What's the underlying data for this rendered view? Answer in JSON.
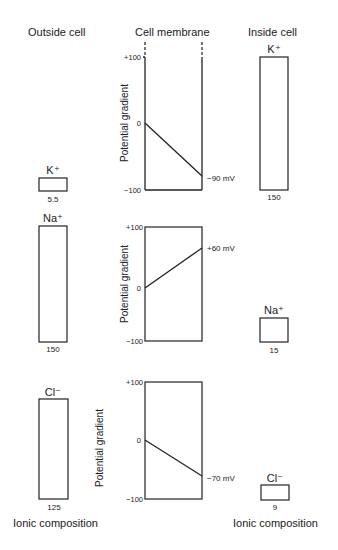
{
  "headers": {
    "outside": "Outside cell",
    "membrane": "Cell membrane",
    "inside": "Inside cell"
  },
  "footer": {
    "left": "Ionic composition",
    "right": "Ionic composition"
  },
  "axis_label": "Potential gradient",
  "ticks": {
    "top": "+100",
    "zero": "0",
    "bottom": "−100"
  },
  "panels": [
    {
      "ion": "K+",
      "ion_label": "K⁺",
      "outside_conc": "5.5",
      "inside_conc": "150",
      "potential_label": "−90 mV",
      "potential": -90
    },
    {
      "ion": "Na+",
      "ion_label": "Na⁺",
      "outside_conc": "150",
      "inside_conc": "15",
      "potential_label": "+60 mV",
      "potential": 60
    },
    {
      "ion": "Cl-",
      "ion_label": "Cl⁻",
      "outside_conc": "125",
      "inside_conc": "9",
      "potential_label": "−70 mV",
      "potential": -70
    }
  ]
}
